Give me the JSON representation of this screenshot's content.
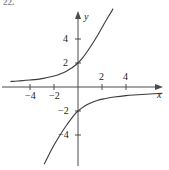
{
  "figure": {
    "exercise_number": "22.",
    "background_color": "#ffffff",
    "ink_color": "#3a3a3a",
    "axis_color": "#4a4a4a",
    "width": 169,
    "height": 170
  },
  "axes": {
    "x_axis_label": "x",
    "y_axis_label": "y",
    "origin_px": {
      "x": 78,
      "y": 87
    },
    "pixels_per_unit": 12
  },
  "labels": {
    "x_neg_4": "−4",
    "x_neg_2": "−2",
    "x_pos_2": "2",
    "x_pos_4": "4",
    "y_pos_2": "2",
    "y_pos_4": "4",
    "y_neg_2": "−2",
    "y_neg_4": "−4"
  },
  "chart_data": {
    "type": "line",
    "title": "",
    "xlabel": "x",
    "ylabel": "y",
    "xlim": [
      -5.6,
      7.2
    ],
    "ylim": [
      -6.5,
      6.8
    ],
    "grid": false,
    "legend": false,
    "legend_position": "none",
    "xticks": [
      -4,
      -2,
      2,
      4
    ],
    "xticklabels": [
      "−4",
      "−2",
      "2",
      "4"
    ],
    "yticks": [
      -4,
      -2,
      2,
      4
    ],
    "yticklabels": [
      "−4",
      "−2",
      "2",
      "4"
    ],
    "annotations": [
      "22."
    ],
    "series": [
      {
        "name": "upper-branch",
        "x": [
          -5.6,
          -5.0,
          -4.0,
          -3.0,
          -2.0,
          -1.5,
          -1.0,
          -0.5,
          0.0,
          0.4,
          0.8,
          1.2,
          1.6,
          2.0,
          2.4,
          2.8,
          2.9
        ],
        "y": [
          0.46,
          0.5,
          0.58,
          0.7,
          0.92,
          1.08,
          1.3,
          1.6,
          2.0,
          2.45,
          3.0,
          3.6,
          4.25,
          4.95,
          5.65,
          6.3,
          6.5
        ]
      },
      {
        "name": "lower-branch",
        "x": [
          -2.8,
          -2.6,
          -2.2,
          -1.8,
          -1.4,
          -1.0,
          -0.6,
          -0.2,
          0.0,
          0.5,
          1.0,
          1.6,
          2.2,
          3.0,
          4.0,
          5.0,
          6.0,
          7.0
        ],
        "y": [
          -6.4,
          -6.0,
          -5.2,
          -4.5,
          -3.85,
          -3.25,
          -2.7,
          -2.2,
          -2.0,
          -1.62,
          -1.35,
          -1.12,
          -0.98,
          -0.84,
          -0.72,
          -0.65,
          -0.58,
          -0.52
        ]
      }
    ]
  }
}
